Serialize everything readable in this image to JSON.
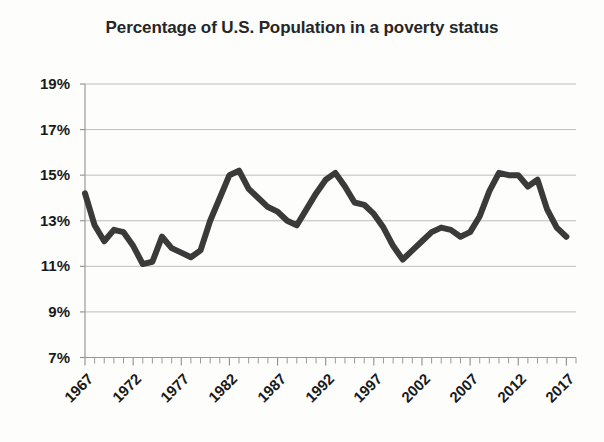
{
  "chart_data": {
    "type": "line",
    "title": "Percentage of U.S. Population in a poverty status",
    "xlabel": "",
    "ylabel": "",
    "ylim": [
      7,
      19
    ],
    "xlim": [
      1967,
      2018
    ],
    "ytick_labels": [
      "19%",
      "17%",
      "15%",
      "13%",
      "11%",
      "9%",
      "7%"
    ],
    "ytick_values": [
      19,
      17,
      15,
      13,
      11,
      9,
      7
    ],
    "xtick_labels": [
      "1967",
      "1972",
      "1977",
      "1982",
      "1987",
      "1992",
      "1997",
      "2002",
      "2007",
      "2012",
      "2017"
    ],
    "xtick_values": [
      1967,
      1972,
      1977,
      1982,
      1987,
      1992,
      1997,
      2002,
      2007,
      2012,
      2017
    ],
    "grid": true,
    "legend": false,
    "line_color": "#3a3a3a",
    "line_width": 6,
    "x": [
      1967,
      1968,
      1969,
      1970,
      1971,
      1972,
      1973,
      1974,
      1975,
      1976,
      1977,
      1978,
      1979,
      1980,
      1981,
      1982,
      1983,
      1984,
      1985,
      1986,
      1987,
      1988,
      1989,
      1990,
      1991,
      1992,
      1993,
      1994,
      1995,
      1996,
      1997,
      1998,
      1999,
      2000,
      2001,
      2002,
      2003,
      2004,
      2005,
      2006,
      2007,
      2008,
      2009,
      2010,
      2011,
      2012,
      2013,
      2014,
      2015,
      2016,
      2017
    ],
    "values": [
      14.2,
      12.8,
      12.1,
      12.6,
      12.5,
      11.9,
      11.1,
      11.2,
      12.3,
      11.8,
      11.6,
      11.4,
      11.7,
      13.0,
      14.0,
      15.0,
      15.2,
      14.4,
      14.0,
      13.6,
      13.4,
      13.0,
      12.8,
      13.5,
      14.2,
      14.8,
      15.1,
      14.5,
      13.8,
      13.7,
      13.3,
      12.7,
      11.9,
      11.3,
      11.7,
      12.1,
      12.5,
      12.7,
      12.6,
      12.3,
      12.5,
      13.2,
      14.3,
      15.1,
      15.0,
      15.0,
      14.5,
      14.8,
      13.5,
      12.7,
      12.3
    ]
  }
}
